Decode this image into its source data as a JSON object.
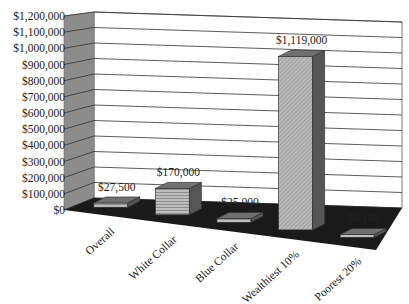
{
  "chart_data": {
    "type": "bar",
    "style": "3d-column",
    "title": "",
    "xlabel": "",
    "ylabel": "",
    "categories": [
      "Overall",
      "White Collar",
      "Blue Collar",
      "Wealthiest 10%",
      "Poorest 20%"
    ],
    "values": [
      27500,
      170000,
      25000,
      1119000,
      8100
    ],
    "data_labels": [
      "$27,500",
      "$170,000",
      "$25,000",
      "$1,119,000",
      "$8,100"
    ],
    "ylim": [
      0,
      1200000
    ],
    "yticks": [
      0,
      100000,
      200000,
      300000,
      400000,
      500000,
      600000,
      700000,
      800000,
      900000,
      1000000,
      1100000,
      1200000
    ],
    "ytick_labels": [
      "$0",
      "$100,000",
      "$200,000",
      "$300,000",
      "$400,000",
      "$500,000",
      "$600,000",
      "$700,000",
      "$800,000",
      "$900,000",
      "$1,000,000",
      "$1,100,000",
      "$1,200,000"
    ],
    "grid": true,
    "legend": "none"
  },
  "colors": {
    "side_wall": "#8c8c8c",
    "floor": "#1a1a1a",
    "bar_front": "#b4b4b4",
    "bar_side": "#555555",
    "bar_top": "#707070",
    "gridline": "#333333"
  }
}
